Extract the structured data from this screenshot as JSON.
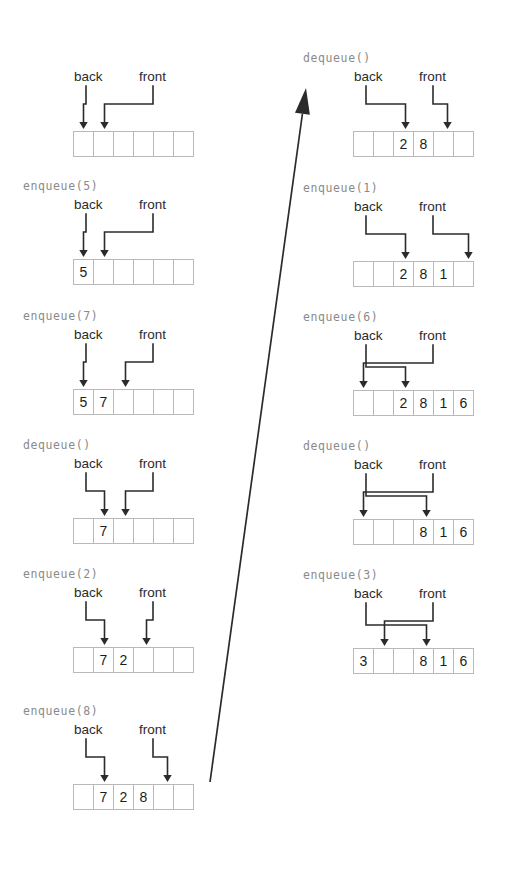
{
  "figure": {
    "cell_count": 6,
    "labels": {
      "back": "back",
      "front": "front"
    },
    "colors": {
      "cell_border": "#b9b9b9",
      "pointer_line": "#2b2b2b",
      "op_text": "#8a8a8a",
      "label_text": "#2b2b2b",
      "value_text": "#1c1c1c",
      "background": "#ffffff"
    },
    "flow_arrow": {
      "name": "continuation-arrow",
      "description": "diagonal arrow from bottom of left column to top of right column",
      "from": [
        210,
        782
      ],
      "to": [
        306,
        88
      ]
    },
    "columns": [
      {
        "name": "left-column",
        "snapshots": [
          {
            "op": "",
            "values": [
              "",
              "",
              "",
              "",
              "",
              ""
            ],
            "back_index": 0,
            "front_index": 1,
            "wrapped": false
          },
          {
            "op": "enqueue(5)",
            "values": [
              "5",
              "",
              "",
              "",
              "",
              ""
            ],
            "back_index": 0,
            "front_index": 1,
            "wrapped": false
          },
          {
            "op": "enqueue(7)",
            "values": [
              "5",
              "7",
              "",
              "",
              "",
              ""
            ],
            "back_index": 0,
            "front_index": 2,
            "wrapped": false
          },
          {
            "op": "dequeue()",
            "values": [
              "",
              "7",
              "",
              "",
              "",
              ""
            ],
            "back_index": 1,
            "front_index": 2,
            "wrapped": false
          },
          {
            "op": "enqueue(2)",
            "values": [
              "",
              "7",
              "2",
              "",
              "",
              ""
            ],
            "back_index": 1,
            "front_index": 3,
            "wrapped": false
          },
          {
            "op": "enqueue(8)",
            "values": [
              "",
              "7",
              "2",
              "8",
              "",
              ""
            ],
            "back_index": 1,
            "front_index": 4,
            "wrapped": false
          }
        ]
      },
      {
        "name": "right-column",
        "snapshots": [
          {
            "op": "dequeue()",
            "values": [
              "",
              "",
              "2",
              "8",
              "",
              ""
            ],
            "back_index": 2,
            "front_index": 4,
            "wrapped": false
          },
          {
            "op": "enqueue(1)",
            "values": [
              "",
              "",
              "2",
              "8",
              "1",
              ""
            ],
            "back_index": 2,
            "front_index": 5,
            "wrapped": false
          },
          {
            "op": "enqueue(6)",
            "values": [
              "",
              "",
              "2",
              "8",
              "1",
              "6"
            ],
            "back_index": 2,
            "front_index": 0,
            "wrapped": true
          },
          {
            "op": "dequeue()",
            "values": [
              "",
              "",
              "",
              "8",
              "1",
              "6"
            ],
            "back_index": 3,
            "front_index": 0,
            "wrapped": true
          },
          {
            "op": "enqueue(3)",
            "values": [
              "3",
              "",
              "",
              "8",
              "1",
              "6"
            ],
            "back_index": 3,
            "front_index": 1,
            "wrapped": true
          }
        ]
      }
    ]
  }
}
